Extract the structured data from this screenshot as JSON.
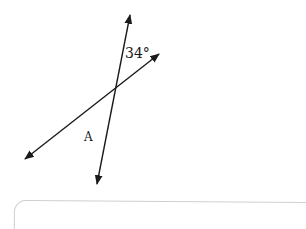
{
  "figure": {
    "type": "intersecting-lines",
    "line_color": "#1a1a1a",
    "lines": [
      {
        "name": "line-1",
        "from": [
          97,
          184
        ],
        "to": [
          130,
          15
        ],
        "arrows": "both"
      },
      {
        "name": "line-2",
        "from": [
          25,
          159
        ],
        "to": [
          159,
          54
        ],
        "arrows": "both"
      }
    ],
    "intersection": [
      116,
      88
    ]
  },
  "labels": {
    "angle": "34°",
    "point": "A"
  },
  "answer_box": {
    "value": "",
    "border_color": "#cfcfcf"
  }
}
